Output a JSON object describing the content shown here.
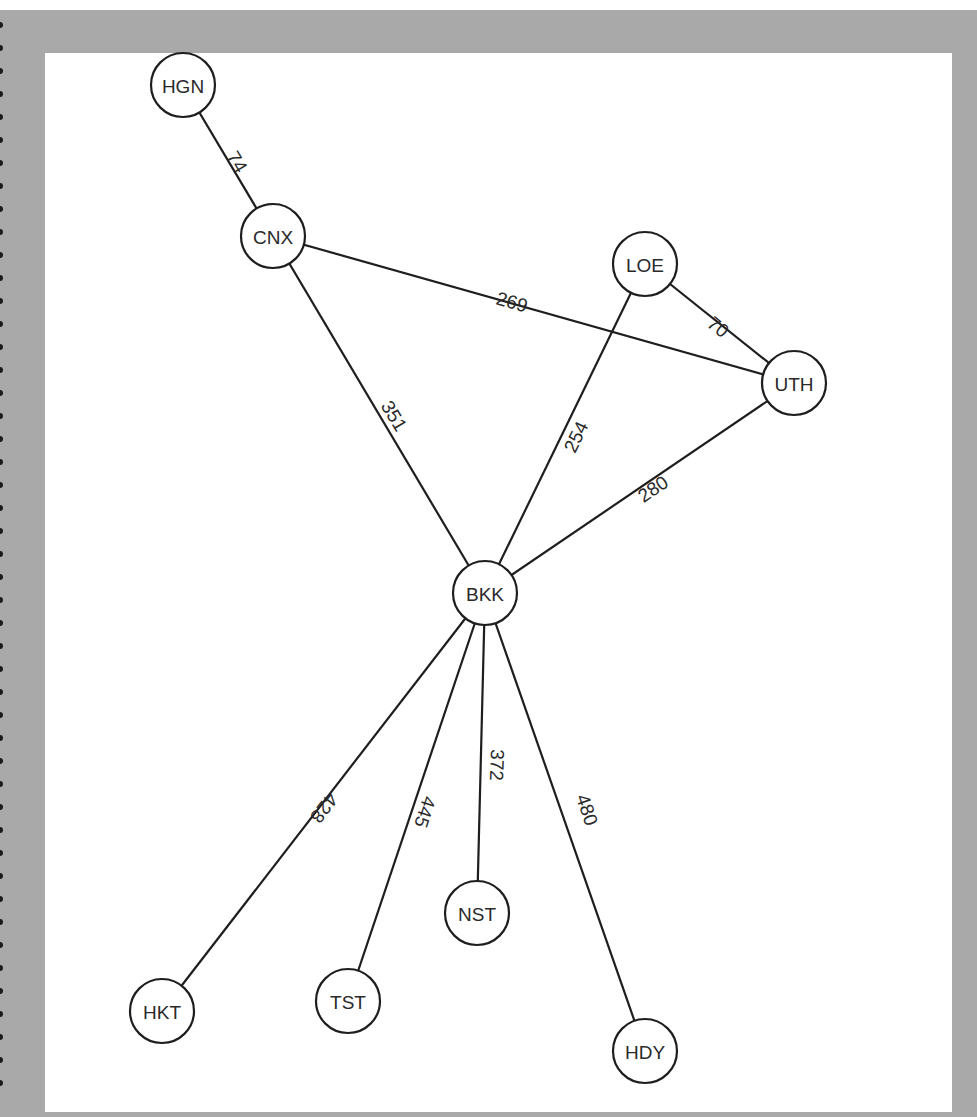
{
  "diagram": {
    "type": "weighted-undirected-graph",
    "nodes": [
      {
        "id": "HGN",
        "label": "HGN",
        "x": 183,
        "y": 85
      },
      {
        "id": "CNX",
        "label": "CNX",
        "x": 273,
        "y": 236
      },
      {
        "id": "LOE",
        "label": "LOE",
        "x": 645,
        "y": 264
      },
      {
        "id": "UTH",
        "label": "UTH",
        "x": 794,
        "y": 383
      },
      {
        "id": "BKK",
        "label": "BKK",
        "x": 485,
        "y": 593
      },
      {
        "id": "NST",
        "label": "NST",
        "x": 477,
        "y": 913
      },
      {
        "id": "HKT",
        "label": "HKT",
        "x": 162,
        "y": 1011
      },
      {
        "id": "TST",
        "label": "TST",
        "x": 348,
        "y": 1001
      },
      {
        "id": "HDY",
        "label": "HDY",
        "x": 645,
        "y": 1051
      }
    ],
    "edges": [
      {
        "from": "HGN",
        "to": "CNX",
        "weight": "74",
        "lx": 237,
        "ly": 162,
        "rot": 59
      },
      {
        "from": "CNX",
        "to": "UTH",
        "weight": "269",
        "lx": 512,
        "ly": 302,
        "rot": 16
      },
      {
        "from": "LOE",
        "to": "UTH",
        "weight": "70",
        "lx": 718,
        "ly": 327,
        "rot": 39
      },
      {
        "from": "CNX",
        "to": "BKK",
        "weight": "351",
        "lx": 394,
        "ly": 416,
        "rot": 59
      },
      {
        "from": "BKK",
        "to": "LOE",
        "weight": "254",
        "lx": 576,
        "ly": 437,
        "rot": -64
      },
      {
        "from": "BKK",
        "to": "UTH",
        "weight": "280",
        "lx": 653,
        "ly": 489,
        "rot": -34
      },
      {
        "from": "BKK",
        "to": "HKT",
        "weight": "428",
        "lx": 324,
        "ly": 808,
        "rot": 128
      },
      {
        "from": "BKK",
        "to": "TST",
        "weight": "445",
        "lx": 425,
        "ly": 812,
        "rot": 108
      },
      {
        "from": "BKK",
        "to": "NST",
        "weight": "372",
        "lx": 497,
        "ly": 765,
        "rot": 92
      },
      {
        "from": "BKK",
        "to": "HDY",
        "weight": "480",
        "lx": 587,
        "ly": 810,
        "rot": 71
      }
    ],
    "node_radius": 32
  },
  "colors": {
    "frame": "#a9a9a9",
    "panel": "#ffffff",
    "stroke": "#1e1e1e",
    "text": "#2a2a2a"
  }
}
